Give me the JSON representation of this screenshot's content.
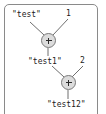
{
  "diagram": {
    "border_color": "#8a8a8a",
    "node_fill": "#dcdcdc",
    "node_stroke": "#7a7a7a",
    "edge_color": "#6e6e6e",
    "text_color": "#1a1a1a",
    "labels": {
      "operand_test": "\"test\"",
      "operand_one": "1",
      "result_test1": "\"test1\"",
      "operand_two": "2",
      "result_test12": "\"test12\""
    },
    "nodes": [
      {
        "id": "plus-1",
        "symbol": "+",
        "cx": 48,
        "cy": 40
      },
      {
        "id": "plus-2",
        "symbol": "+",
        "cx": 68,
        "cy": 82
      }
    ],
    "edges": [
      {
        "from": "operand_test",
        "to": "plus-1"
      },
      {
        "from": "operand_one",
        "to": "plus-1"
      },
      {
        "from": "plus-1",
        "to": "result_test1"
      },
      {
        "from": "result_test1",
        "to": "plus-2"
      },
      {
        "from": "operand_two",
        "to": "plus-2"
      },
      {
        "from": "plus-2",
        "to": "result_test12"
      }
    ]
  }
}
